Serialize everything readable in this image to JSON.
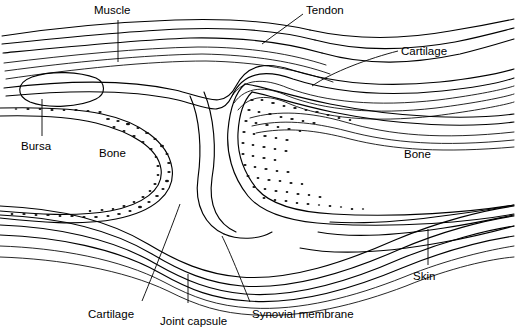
{
  "figure": {
    "type": "anatomical-line-diagram",
    "background_color": "#ffffff",
    "line_color": "#000000",
    "width": 516,
    "height": 334
  },
  "labels": {
    "muscle": "Muscle",
    "tendon": "Tendon",
    "cartilage_top": "Cartilage",
    "bursa": "Bursa",
    "bone_left": "Bone",
    "bone_right": "Bone",
    "skin": "Skin",
    "cartilage_bottom": "Cartilage",
    "joint_capsule": "Joint capsule",
    "synovial_membrane": "Synovial membrane"
  },
  "structures": [
    {
      "name": "muscle",
      "label": "Muscle",
      "position": "upper-left"
    },
    {
      "name": "tendon",
      "label": "Tendon",
      "position": "upper-center-right"
    },
    {
      "name": "cartilage-upper",
      "label": "Cartilage",
      "position": "upper-right"
    },
    {
      "name": "bursa",
      "label": "Bursa",
      "position": "left"
    },
    {
      "name": "bone-left",
      "label": "Bone",
      "position": "left-center"
    },
    {
      "name": "bone-right",
      "label": "Bone",
      "position": "right-center"
    },
    {
      "name": "skin",
      "label": "Skin",
      "position": "lower-right"
    },
    {
      "name": "cartilage-lower",
      "label": "Cartilage",
      "position": "lower-left"
    },
    {
      "name": "joint-capsule",
      "label": "Joint capsule",
      "position": "bottom-center"
    },
    {
      "name": "synovial-membrane",
      "label": "Synovial membrane",
      "position": "bottom-right"
    }
  ]
}
